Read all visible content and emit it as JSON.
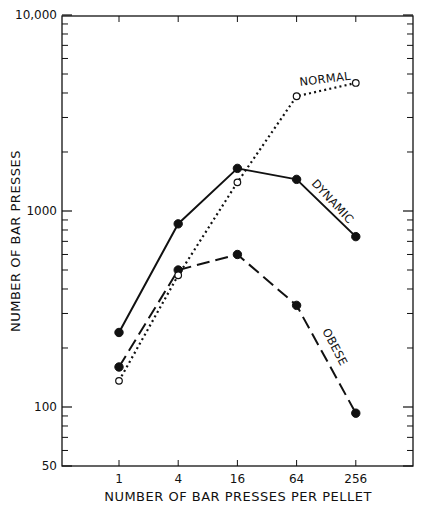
{
  "chart_data": {
    "type": "line",
    "title": "",
    "xlabel": "NUMBER OF BAR PRESSES PER PELLET",
    "ylabel": "NUMBER OF BAR PRESSES",
    "x_scale": "log4 (categorical spacing)",
    "y_scale": "log",
    "categories": [
      "1",
      "4",
      "16",
      "64",
      "256"
    ],
    "x": [
      1,
      4,
      16,
      64,
      256
    ],
    "ylim": [
      50,
      10000
    ],
    "y_ticks": [
      {
        "value": 50,
        "label": "50"
      },
      {
        "value": 100,
        "label": "100"
      },
      {
        "value": 1000,
        "label": "1000"
      },
      {
        "value": 10000,
        "label": "10,000"
      }
    ],
    "grid": false,
    "legend": "inline labels",
    "series": [
      {
        "name": "DYNAMIC",
        "style": "solid",
        "marker": "filled-circle",
        "values": [
          240,
          860,
          1650,
          1450,
          740
        ]
      },
      {
        "name": "OBESE",
        "style": "dashed",
        "marker": "filled-circle",
        "values": [
          160,
          500,
          600,
          330,
          93
        ]
      },
      {
        "name": "NORMAL",
        "style": "dotted",
        "marker": "open-circle",
        "values": [
          136,
          470,
          1400,
          3850,
          4500
        ]
      }
    ]
  },
  "labels": {
    "dynamic": "DYNAMIC",
    "obese": "OBESE",
    "normal": "NORMAL",
    "xlabel": "NUMBER OF BAR PRESSES PER PELLET",
    "ylabel": "NUMBER OF BAR PRESSES"
  },
  "colors": {
    "ink": "#111111",
    "background": "#ffffff"
  }
}
